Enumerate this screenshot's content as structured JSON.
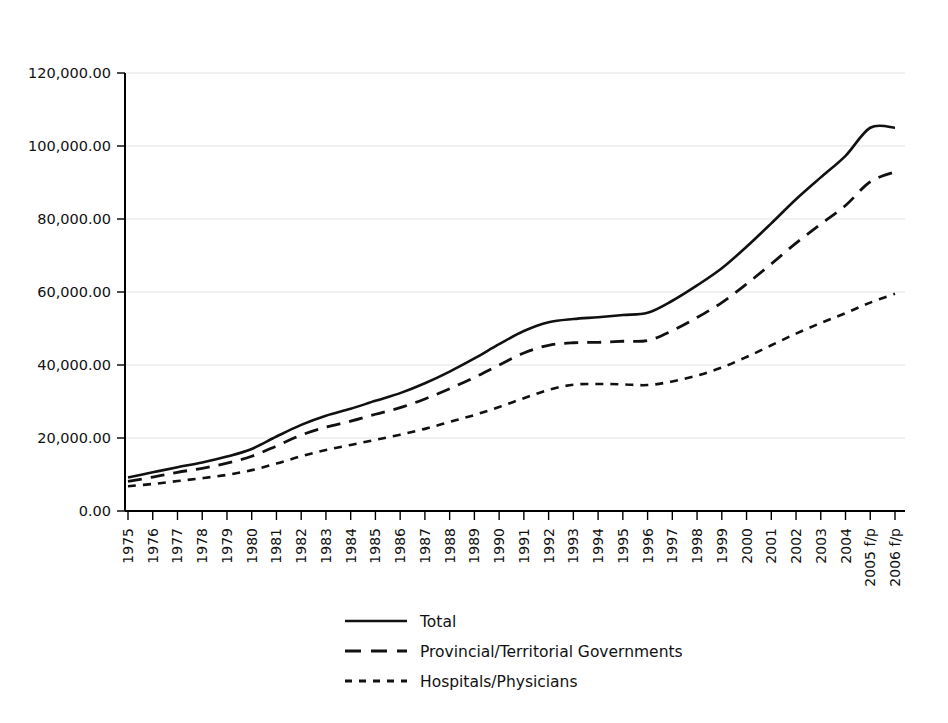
{
  "chart_data": {
    "type": "line",
    "title": "",
    "subtitle": "",
    "xlabel": "",
    "ylabel": "",
    "grid": true,
    "legend_position": "bottom-center",
    "ylim": [
      0,
      120000
    ],
    "ytick_labels": [
      "120,000.00",
      "100,000.00",
      "80,000.00",
      "60,000.00",
      "40,000.00",
      "20,000.00",
      "0.00"
    ],
    "ytick_values": [
      120000,
      100000,
      80000,
      60000,
      40000,
      20000,
      0
    ],
    "categories": [
      "1975",
      "1976",
      "1977",
      "1978",
      "1979",
      "1980",
      "1981",
      "1982",
      "1983",
      "1984",
      "1985",
      "1986",
      "1987",
      "1988",
      "1989",
      "1990",
      "1991",
      "1992",
      "1993",
      "1994",
      "1995",
      "1996",
      "1997",
      "1998",
      "1999",
      "2000",
      "2001",
      "2002",
      "2003",
      "2004",
      "2005 f/p",
      "2006 f/p"
    ],
    "series": [
      {
        "name": "Total",
        "style": "solid",
        "values": [
          9200,
          10600,
          12000,
          13300,
          14900,
          17000,
          20400,
          23600,
          26100,
          28000,
          30200,
          32300,
          35000,
          38200,
          41800,
          45700,
          49300,
          51700,
          52600,
          53100,
          53700,
          54300,
          57600,
          61800,
          66500,
          72400,
          78800,
          85400,
          91400,
          97300,
          105000,
          105000
        ]
      },
      {
        "name": "Provincial/Territorial Governments",
        "style": "long-dash",
        "values": [
          8100,
          9300,
          10600,
          11700,
          13100,
          15000,
          17800,
          20800,
          23000,
          24600,
          26500,
          28300,
          30700,
          33500,
          36600,
          40000,
          43300,
          45400,
          46100,
          46200,
          46500,
          46700,
          49400,
          53000,
          57100,
          62200,
          67700,
          73400,
          78600,
          83700,
          90200,
          92900
        ]
      },
      {
        "name": "Hospitals/Physicians",
        "style": "short-dash",
        "values": [
          6800,
          7400,
          8200,
          9000,
          9900,
          11200,
          13000,
          15000,
          16700,
          18100,
          19500,
          20900,
          22500,
          24400,
          26300,
          28500,
          30900,
          33200,
          34600,
          34800,
          34700,
          34500,
          35500,
          37100,
          39300,
          42200,
          45400,
          48600,
          51500,
          54200,
          57100,
          59500
        ]
      }
    ]
  },
  "legend": {
    "items": [
      {
        "label": "Total",
        "style": "solid"
      },
      {
        "label": "Provincial/Territorial Governments",
        "style": "long-dash"
      },
      {
        "label": "Hospitals/Physicians",
        "style": "short-dash"
      }
    ]
  },
  "colors": {
    "background": "#ffffff",
    "ink": "#111111",
    "grid": "#e3e3e3",
    "axis": "#000000"
  }
}
